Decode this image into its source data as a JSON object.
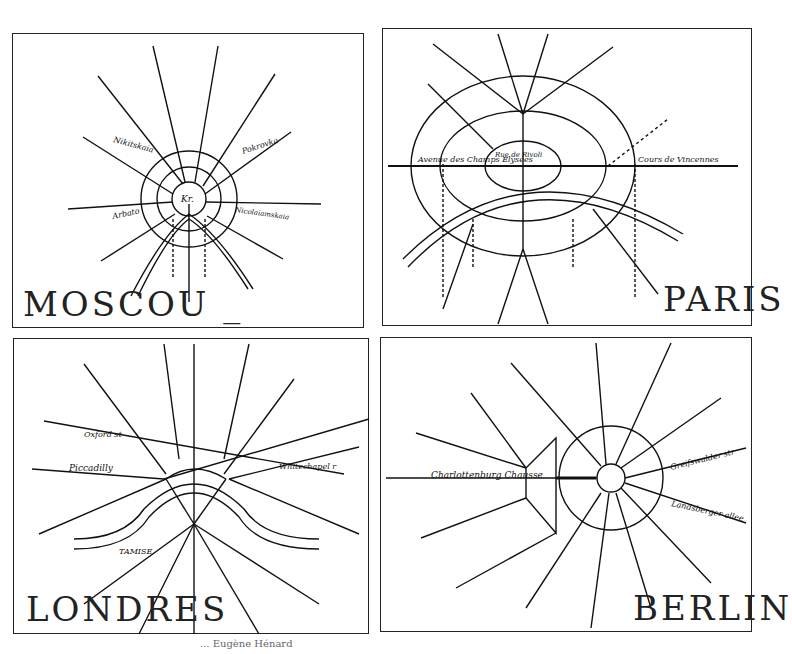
{
  "panels": [
    {
      "id": "moscou",
      "title": "MOSCOU _",
      "center_label": "Kr.",
      "rings": [
        "Boulevards",
        "Kitai Gorod"
      ],
      "radials": [
        "St Petersbourg",
        "Tverskaia",
        "Petrovka",
        "Miechtchanskaia",
        "Miasnitskaia",
        "Pokrovka",
        "Nicolaiamskaia",
        "Vorontzovskaia",
        "Piatnitskaia",
        "Moskova",
        "Tsaritsynskaia",
        "Arbato",
        "Nikitskaia"
      ],
      "ring_labels": [
        "Rue des Jardins",
        "Sadovaia",
        "Valovaia"
      ],
      "scale": "1 kilom"
    },
    {
      "id": "paris",
      "title": "PARIS",
      "radials": [
        "Pte de St Denis",
        "Route de Flandre",
        "Pte d'Enieres",
        "Bd Ornano",
        "R. d'Allemagne",
        "Pte de Noisy",
        "Avenue de Clichy",
        "Avenue des Champs Elysees",
        "Cours de Vincennes",
        "Pte de Versailles",
        "Pte de Charenton",
        "Pte des Moulineaux",
        "Pte de Chatillon",
        "Pte d'Orleans",
        "Pte de Villejuif"
      ],
      "ring_labels": [
        "Boulevards des Fortifications",
        "Boulevards Exterieurs",
        "Grands Boulevards",
        "Rue de Rivoli",
        "Boulevard St Germain",
        "Bd Montparnasse",
        "Bd de la Gare",
        "Bd Voltaire",
        "Bd Magenta",
        "R. Lafayette",
        "Bd St Michel",
        "Bd St Marcel",
        "Bd Port Royal",
        "Bd St Jacques",
        "Bd Grenelle"
      ],
      "places": [
        "P. de l'Etoile",
        "P. de la Nation",
        "Concorde",
        "Bastille",
        "P. de la Republique"
      ],
      "river": "SEINE",
      "scales": [
        "4 Kilom",
        "8 Kilom"
      ]
    },
    {
      "id": "londres",
      "title": "LONDRES",
      "radials": [
        "Tottenham",
        "Regent st",
        "Farringdon st",
        "Moorgate st",
        "Kingsland",
        "Oxford st",
        "Clerkenwell r",
        "Piccadilly",
        "Whitechapel r",
        "Kings Road",
        "The Mall",
        "Commercial r",
        "Battersea r",
        "Clapham r",
        "Walworth",
        "Old Kent r",
        "Southwark r"
      ],
      "places": [
        "Trafalgar sq",
        "Holborn",
        "Strand",
        "Bank",
        "St George's Circus"
      ],
      "river": "TAMISE",
      "scale": "3 Kilom"
    },
    {
      "id": "berlin",
      "title": "BERLIN",
      "radials": [
        "Muller str",
        "Brunnen str",
        "Schonhauser str",
        "Prenzlauer str",
        "Greifswalder str",
        "Landsberger allee",
        "Frankfurter Al",
        "Kopenicker str",
        "Dresden str",
        "Belle Alliance",
        "Potsdam str",
        "Kurfurst. dam",
        "Charlottenburg Chausse",
        "alt Moabit",
        "Heide str"
      ],
      "places": [
        "Unter den Linden",
        "Kon. str",
        "Sieges Al",
        "Friedrich strasse",
        "Dorotheen"
      ],
      "scale": "1 kil"
    }
  ],
  "caption": "... Eugène Hénard"
}
